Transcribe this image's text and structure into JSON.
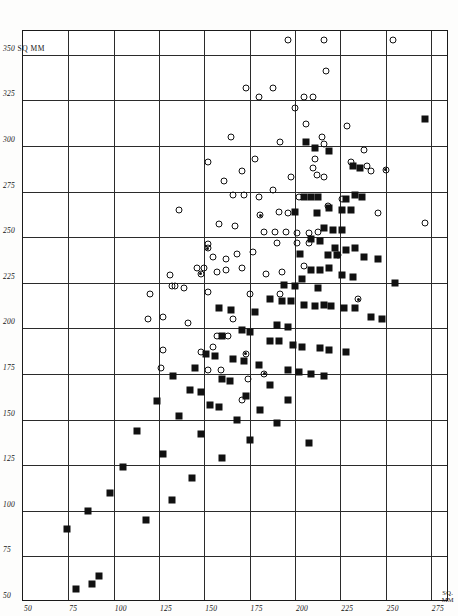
{
  "figure": {
    "background_color": "#ffffff",
    "ink_color": "#111111",
    "axis_unit_label": "SQ MM",
    "corner_unit_line1": "SQ.",
    "corner_unit_line2": "MM"
  },
  "chart_data": {
    "type": "scatter",
    "title": "",
    "subtitle": "",
    "xlabel": "SQ. MM",
    "ylabel": "SQ MM",
    "xlim": [
      50,
      285
    ],
    "ylim": [
      50,
      363
    ],
    "grid": true,
    "legend_position": "none",
    "xticks": [
      50,
      75,
      100,
      125,
      150,
      175,
      200,
      225,
      250,
      275
    ],
    "xticklabels": [
      "50",
      "75",
      "100",
      "125",
      "150",
      "175",
      "200",
      "225",
      "250",
      "275"
    ],
    "yticks": [
      50,
      75,
      100,
      125,
      150,
      175,
      200,
      225,
      250,
      275,
      300,
      325,
      350
    ],
    "yticklabels": [
      "50",
      "75",
      "100",
      "125",
      "150",
      "175",
      "200",
      "225",
      "250",
      "275",
      "300",
      "325",
      "350"
    ],
    "y_unit_suffix_at_350": "SQ MM",
    "annotations": [],
    "series": [
      {
        "name": "open-circle",
        "marker": "open-circle",
        "color": "#111111",
        "points": [
          [
            196,
            358
          ],
          [
            216,
            358
          ],
          [
            254,
            358
          ],
          [
            173,
            332
          ],
          [
            180,
            327
          ],
          [
            188,
            332
          ],
          [
            205,
            327
          ],
          [
            210,
            327
          ],
          [
            217,
            341
          ],
          [
            200,
            321
          ],
          [
            206,
            312
          ],
          [
            165,
            305
          ],
          [
            192,
            302
          ],
          [
            215,
            305
          ],
          [
            216,
            301
          ],
          [
            229,
            311
          ],
          [
            238,
            298
          ],
          [
            178,
            293
          ],
          [
            210,
            288
          ],
          [
            211,
            293
          ],
          [
            231,
            291
          ],
          [
            240,
            289
          ],
          [
            171,
            286
          ],
          [
            198,
            283
          ],
          [
            212,
            284
          ],
          [
            216,
            283
          ],
          [
            242,
            286
          ],
          [
            152,
            291
          ],
          [
            161,
            281
          ],
          [
            166,
            273
          ],
          [
            172,
            273
          ],
          [
            180,
            272
          ],
          [
            188,
            276
          ],
          [
            202,
            272
          ],
          [
            226,
            271
          ],
          [
            136,
            265
          ],
          [
            191,
            264
          ],
          [
            196,
            263
          ],
          [
            218,
            267
          ],
          [
            246,
            263
          ],
          [
            272,
            258
          ],
          [
            158,
            257
          ],
          [
            167,
            256
          ],
          [
            183,
            253
          ],
          [
            189,
            253
          ],
          [
            195,
            253
          ],
          [
            201,
            252
          ],
          [
            208,
            252
          ],
          [
            213,
            253
          ],
          [
            152,
            246
          ],
          [
            190,
            247
          ],
          [
            201,
            247
          ],
          [
            208,
            247
          ],
          [
            155,
            239
          ],
          [
            162,
            238
          ],
          [
            168,
            241
          ],
          [
            177,
            242
          ],
          [
            146,
            233
          ],
          [
            150,
            233
          ],
          [
            157,
            231
          ],
          [
            162,
            232
          ],
          [
            171,
            233
          ],
          [
            131,
            229
          ],
          [
            184,
            230
          ],
          [
            193,
            231
          ],
          [
            132,
            223
          ],
          [
            134,
            223
          ],
          [
            139,
            222
          ],
          [
            152,
            220
          ],
          [
            120,
            219
          ],
          [
            175,
            219
          ],
          [
            192,
            219
          ],
          [
            127,
            206
          ],
          [
            141,
            203
          ],
          [
            166,
            205
          ],
          [
            157,
            196
          ],
          [
            163,
            196
          ],
          [
            127,
            188
          ],
          [
            148,
            187
          ],
          [
            155,
            190
          ],
          [
            126,
            178
          ],
          [
            152,
            177
          ],
          [
            159,
            177
          ],
          [
            174,
            172
          ],
          [
            171,
            161
          ],
          [
            119,
            205
          ],
          [
            205,
            234
          ]
        ]
      },
      {
        "name": "filled-square",
        "marker": "filled-square",
        "color": "#111111",
        "points": [
          [
            272,
            315
          ],
          [
            206,
            302
          ],
          [
            211,
            299
          ],
          [
            219,
            297
          ],
          [
            232,
            289
          ],
          [
            236,
            288
          ],
          [
            205,
            272
          ],
          [
            209,
            272
          ],
          [
            213,
            272
          ],
          [
            228,
            271
          ],
          [
            233,
            273
          ],
          [
            237,
            272
          ],
          [
            219,
            266
          ],
          [
            226,
            265
          ],
          [
            231,
            265
          ],
          [
            200,
            264
          ],
          [
            212,
            263
          ],
          [
            216,
            255
          ],
          [
            221,
            254
          ],
          [
            226,
            254
          ],
          [
            209,
            249
          ],
          [
            214,
            248
          ],
          [
            222,
            244
          ],
          [
            228,
            243
          ],
          [
            233,
            244
          ],
          [
            203,
            241
          ],
          [
            218,
            240
          ],
          [
            223,
            240
          ],
          [
            238,
            239
          ],
          [
            246,
            238
          ],
          [
            209,
            232
          ],
          [
            214,
            232
          ],
          [
            219,
            233
          ],
          [
            204,
            227
          ],
          [
            226,
            229
          ],
          [
            232,
            228
          ],
          [
            255,
            225
          ],
          [
            194,
            224
          ],
          [
            200,
            223
          ],
          [
            213,
            222
          ],
          [
            186,
            216
          ],
          [
            193,
            215
          ],
          [
            198,
            215
          ],
          [
            205,
            213
          ],
          [
            211,
            212
          ],
          [
            216,
            213
          ],
          [
            220,
            212
          ],
          [
            227,
            211
          ],
          [
            233,
            211
          ],
          [
            158,
            211
          ],
          [
            165,
            210
          ],
          [
            178,
            209
          ],
          [
            242,
            206
          ],
          [
            248,
            205
          ],
          [
            190,
            202
          ],
          [
            196,
            201
          ],
          [
            171,
            199
          ],
          [
            175,
            198
          ],
          [
            160,
            196
          ],
          [
            186,
            193
          ],
          [
            191,
            193
          ],
          [
            199,
            191
          ],
          [
            204,
            190
          ],
          [
            214,
            189
          ],
          [
            219,
            188
          ],
          [
            228,
            187
          ],
          [
            151,
            186
          ],
          [
            156,
            185
          ],
          [
            166,
            183
          ],
          [
            172,
            182
          ],
          [
            180,
            180
          ],
          [
            145,
            178
          ],
          [
            196,
            177
          ],
          [
            202,
            176
          ],
          [
            209,
            175
          ],
          [
            216,
            174
          ],
          [
            133,
            174
          ],
          [
            160,
            172
          ],
          [
            164,
            171
          ],
          [
            186,
            169
          ],
          [
            142,
            166
          ],
          [
            148,
            165
          ],
          [
            173,
            163
          ],
          [
            196,
            161
          ],
          [
            124,
            160
          ],
          [
            153,
            158
          ],
          [
            158,
            157
          ],
          [
            181,
            155
          ],
          [
            136,
            152
          ],
          [
            168,
            150
          ],
          [
            190,
            148
          ],
          [
            113,
            144
          ],
          [
            148,
            142
          ],
          [
            175,
            139
          ],
          [
            208,
            137
          ],
          [
            127,
            131
          ],
          [
            160,
            129
          ],
          [
            105,
            124
          ],
          [
            143,
            118
          ],
          [
            98,
            110
          ],
          [
            132,
            106
          ],
          [
            86,
            100
          ],
          [
            118,
            95
          ],
          [
            74,
            90
          ],
          [
            92,
            64
          ],
          [
            79,
            57
          ],
          [
            88,
            60
          ]
        ]
      },
      {
        "name": "overlapped-marker",
        "marker": "circle-with-dot",
        "color": "#111111",
        "points": [
          [
            181,
            262
          ],
          [
            152,
            244
          ],
          [
            148,
            230
          ],
          [
            224,
            240
          ],
          [
            235,
            216
          ],
          [
            173,
            186
          ],
          [
            183,
            175
          ],
          [
            250,
            287
          ]
        ]
      }
    ]
  }
}
